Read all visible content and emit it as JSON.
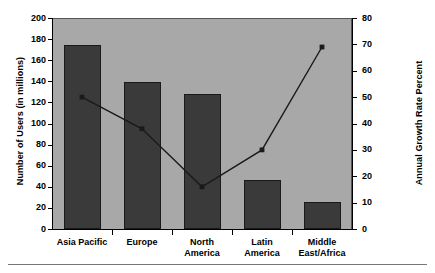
{
  "chart_data": {
    "type": "bar",
    "title": "",
    "subtitle": "",
    "categories": [
      "Asia Pacific",
      "Europe",
      "North America",
      "Latin America",
      "Middle East/Africa"
    ],
    "category_lines": [
      [
        "Asia Pacific"
      ],
      [
        "Europe"
      ],
      [
        "North",
        "America"
      ],
      [
        "Latin",
        "America"
      ],
      [
        "Middle",
        "East/Africa"
      ]
    ],
    "series": [
      {
        "name": "Number of Users (in millions)",
        "type": "bar",
        "axis": "left",
        "values": [
          174,
          139,
          128,
          46,
          26
        ]
      },
      {
        "name": "Annual Growth Rate Percent",
        "type": "line",
        "axis": "right",
        "marker": "square",
        "values": [
          50,
          38,
          16,
          30,
          69
        ]
      }
    ],
    "xlabel": "",
    "ylabel": "Number of Users (in millions)",
    "y2label": "Annual Growth Rate Percent",
    "ylim": [
      0,
      200
    ],
    "y2lim": [
      0,
      80
    ],
    "yticks": [
      0,
      20,
      40,
      60,
      80,
      100,
      120,
      140,
      160,
      180,
      200
    ],
    "y2ticks": [
      0,
      10,
      20,
      30,
      40,
      50,
      60,
      70,
      80
    ],
    "grid": false,
    "legend": "none",
    "colors": {
      "plot_background": "#a8a8a8",
      "bar_fill": "#3a3a3a",
      "bar_border": "#1a1a1a",
      "line": "#1a1a1a",
      "marker": "#1a1a1a",
      "axis": "#000000",
      "text": "#000000",
      "page_background": "#ffffff",
      "rule": "#777777"
    }
  },
  "axes": {
    "left_ticks": [
      "200",
      "180",
      "160",
      "140",
      "120",
      "100",
      "80",
      "60",
      "40",
      "20",
      "0"
    ],
    "right_ticks": [
      "80",
      "70",
      "60",
      "50",
      "40",
      "30",
      "20",
      "10",
      "0"
    ],
    "left_title": "Number of Users (in millions)",
    "right_title": "Annual Growth Rate Percent"
  }
}
